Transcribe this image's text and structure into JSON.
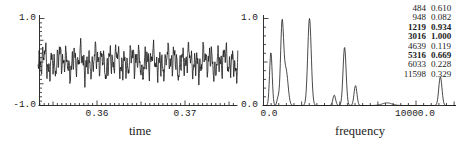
{
  "colors": {
    "ink": "#1c1c1c",
    "background": "#ffffff"
  },
  "left_plot": {
    "xlabel": "time",
    "y_top_label": "1.0",
    "y_bottom_label": "-1.0",
    "x_tick_labels": [
      "0.36",
      "0.37"
    ]
  },
  "right_plot": {
    "xlabel": "frequency",
    "y_top_label": "1.0",
    "y_bottom_label": "0.0",
    "x_tick_labels": [
      "0.0",
      "10000.0"
    ]
  },
  "peak_table": {
    "rows": [
      {
        "freq": "484",
        "amp": "0.610",
        "bold": false
      },
      {
        "freq": "948",
        "amp": "0.082",
        "bold": false
      },
      {
        "freq": "1219",
        "amp": "0.934",
        "bold": true
      },
      {
        "freq": "3016",
        "amp": "1.000",
        "bold": true
      },
      {
        "freq": "4639",
        "amp": "0.119",
        "bold": false
      },
      {
        "freq": "5316",
        "amp": "0.669",
        "bold": true
      },
      {
        "freq": "6033",
        "amp": "0.228",
        "bold": false
      },
      {
        "freq": "11598",
        "amp": "0.329",
        "bold": false
      }
    ]
  },
  "chart_data": [
    {
      "type": "line",
      "title": "",
      "xlabel": "time",
      "ylabel": "",
      "xlim": [
        0.3533,
        0.376
      ],
      "ylim": [
        -1.0,
        1.0
      ],
      "x_ticks": [
        0.36,
        0.37
      ],
      "x_minor_step": 0.0005,
      "y_minor_step": 0.1,
      "grid": false,
      "description": "band-limited noise-like signal: sum of the sinusoidal components listed in peaks of the spectrum chart",
      "synthesis": {
        "scale": 0.17,
        "n_samples": 760,
        "components": [
          {
            "freq": 484,
            "amp": 0.61
          },
          {
            "freq": 948,
            "amp": 0.082
          },
          {
            "freq": 1219,
            "amp": 0.934
          },
          {
            "freq": 3016,
            "amp": 1.0
          },
          {
            "freq": 4639,
            "amp": 0.119
          },
          {
            "freq": 5316,
            "amp": 0.669
          },
          {
            "freq": 6033,
            "amp": 0.228
          },
          {
            "freq": 11598,
            "amp": 0.329
          }
        ]
      }
    },
    {
      "type": "line",
      "title": "",
      "xlabel": "frequency",
      "ylabel": "",
      "xlim": [
        0,
        12620
      ],
      "ylim": [
        0.0,
        1.0
      ],
      "x_ticks": [
        0,
        10000
      ],
      "x_minor_step": 500,
      "y_minor_step": 0.1,
      "grid": false,
      "peaks": [
        {
          "freq": 484,
          "amp": 0.61,
          "sigma": 85
        },
        {
          "freq": 948,
          "amp": 0.082,
          "sigma": 70
        },
        {
          "freq": 1219,
          "amp": 0.934,
          "sigma": 100
        },
        {
          "freq": 3016,
          "amp": 1.0,
          "sigma": 115
        },
        {
          "freq": 4639,
          "amp": 0.119,
          "sigma": 90
        },
        {
          "freq": 5316,
          "amp": 0.669,
          "sigma": 100
        },
        {
          "freq": 6033,
          "amp": 0.228,
          "sigma": 95
        },
        {
          "freq": 11598,
          "amp": 0.329,
          "sigma": 105
        }
      ],
      "minor_features": [
        {
          "freq": 1480,
          "amp": 0.4,
          "sigma": 130,
          "note": "shoulder on right side of 1219 peak"
        },
        {
          "freq": 8100,
          "amp": 0.03,
          "sigma": 320,
          "note": "small unlabeled bump"
        }
      ]
    }
  ]
}
